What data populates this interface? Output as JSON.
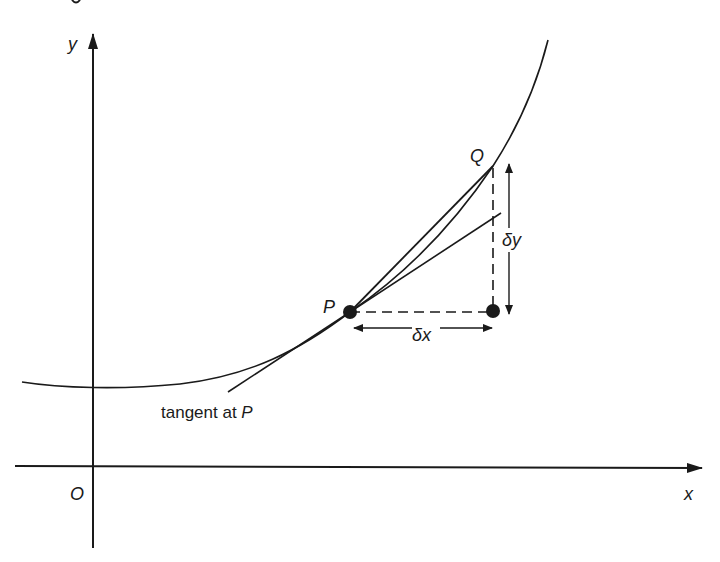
{
  "diagram": {
    "colors": {
      "ink": "#1a1a1a",
      "background": "#ffffff"
    },
    "axes": {
      "x_label": "x",
      "y_label": "y",
      "origin_label": "O"
    },
    "points": {
      "p_label": "P",
      "q_label": "Q"
    },
    "increments": {
      "dx_label": "δx",
      "dy_label": "δy"
    },
    "annotations": {
      "tangent_label_prefix": "tangent at ",
      "tangent_label_point": "P"
    }
  }
}
